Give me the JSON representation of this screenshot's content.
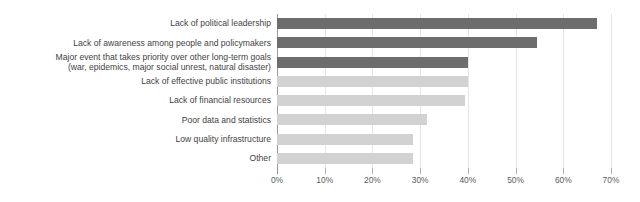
{
  "chart_data": {
    "type": "bar",
    "orientation": "horizontal",
    "title": "",
    "subtitle": "",
    "xlabel": "",
    "ylabel": "",
    "xlim": [
      0,
      70
    ],
    "grid": true,
    "legend": "none",
    "tick_suffix": "%",
    "tick_labels": [
      "0%",
      "10%",
      "20%",
      "30%",
      "40%",
      "50%",
      "60%",
      "70%"
    ],
    "tick_values": [
      0,
      10,
      20,
      30,
      40,
      50,
      60,
      70
    ],
    "categories": [
      "Lack of political leadership",
      "Lack of awareness among people and policymakers",
      "Major event that takes priority over other long-term goals (war, epidemics, major social unrest, natural disaster)",
      "Lack of effective public institutions",
      "Lack of financial resources",
      "Poor data and statistics",
      "Low quality infrastructure",
      "Other"
    ],
    "category_lines": [
      [
        "Lack of political leadership"
      ],
      [
        "Lack of awareness among people and policymakers"
      ],
      [
        "Major event that takes priority over other long-term goals",
        "(war, epidemics, major social unrest, natural disaster)"
      ],
      [
        "Lack of effective public institutions"
      ],
      [
        "Lack of financial resources"
      ],
      [
        "Poor data and statistics"
      ],
      [
        "Low quality infrastructure"
      ],
      [
        "Other"
      ]
    ],
    "values": [
      67,
      54.5,
      40,
      40,
      39.5,
      31.5,
      28.5,
      28.5
    ],
    "bar_styles": [
      "dark",
      "dark",
      "dark",
      "light",
      "light",
      "light",
      "light",
      "light"
    ]
  },
  "colors": {
    "bar_dark": "#6d6d6d",
    "bar_light": "#d2d2d2",
    "gridline": "#e6e6e6",
    "axis": "#9a9a9a",
    "label_text": "#3f3f3f",
    "tick_text": "#5a5a5a",
    "background": "#ffffff"
  }
}
